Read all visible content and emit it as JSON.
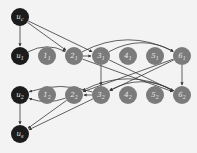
{
  "colors": {
    "background": "#f3f3f3",
    "dark_node": "#1c1c1c",
    "gray_node": "#7b7b7b",
    "edge": "#3a3a3a",
    "label": "#e8e8e8"
  },
  "nodes": [
    {
      "id": "uc",
      "label": "u_c",
      "x": 20,
      "y": 17,
      "type": "dark"
    },
    {
      "id": "u1",
      "label": "u_1",
      "x": 20,
      "y": 56,
      "type": "dark"
    },
    {
      "id": "n11",
      "label": "1_1",
      "x": 47,
      "y": 56,
      "type": "gray"
    },
    {
      "id": "n21",
      "label": "2_1",
      "x": 74,
      "y": 56,
      "type": "gray"
    },
    {
      "id": "n31",
      "label": "3_1",
      "x": 101,
      "y": 56,
      "type": "gray"
    },
    {
      "id": "n41",
      "label": "4_1",
      "x": 128,
      "y": 56,
      "type": "gray"
    },
    {
      "id": "n51",
      "label": "5_1",
      "x": 155,
      "y": 56,
      "type": "gray"
    },
    {
      "id": "n61",
      "label": "6_1",
      "x": 182,
      "y": 56,
      "type": "gray"
    },
    {
      "id": "u2",
      "label": "u_2",
      "x": 20,
      "y": 95,
      "type": "dark"
    },
    {
      "id": "n12",
      "label": "1_2",
      "x": 47,
      "y": 95,
      "type": "gray"
    },
    {
      "id": "n22",
      "label": "2_2",
      "x": 74,
      "y": 95,
      "type": "gray"
    },
    {
      "id": "n32",
      "label": "3_2",
      "x": 101,
      "y": 95,
      "type": "gray"
    },
    {
      "id": "n42",
      "label": "4_2",
      "x": 128,
      "y": 95,
      "type": "gray"
    },
    {
      "id": "n52",
      "label": "5_2",
      "x": 155,
      "y": 95,
      "type": "gray"
    },
    {
      "id": "n62",
      "label": "6_2",
      "x": 182,
      "y": 95,
      "type": "gray"
    },
    {
      "id": "us",
      "label": "u_s",
      "x": 20,
      "y": 134,
      "type": "dark"
    }
  ],
  "edges": [
    {
      "from": "uc",
      "to": "u1",
      "curve": 0
    },
    {
      "from": "uc",
      "to": "n21",
      "curve": 0
    },
    {
      "from": "uc",
      "to": "n31",
      "curve": 0
    },
    {
      "from": "u1",
      "to": "n21",
      "curve": -14
    },
    {
      "from": "n21",
      "to": "n31",
      "curve": 0
    },
    {
      "from": "n31",
      "to": "n61",
      "curve": -22
    },
    {
      "from": "n21",
      "to": "n61",
      "curve": -28
    },
    {
      "from": "n31",
      "to": "n32",
      "curve": 0
    },
    {
      "from": "n61",
      "to": "n62",
      "curve": 0
    },
    {
      "from": "n31",
      "to": "n62",
      "curve": 0
    },
    {
      "from": "n61",
      "to": "n32",
      "curve": 0
    },
    {
      "from": "n21",
      "to": "n62",
      "curve": 0
    },
    {
      "from": "n61",
      "to": "n22",
      "curve": 0
    },
    {
      "from": "u2",
      "to": "us",
      "curve": 0
    },
    {
      "from": "n22",
      "to": "us",
      "curve": 0
    },
    {
      "from": "n32",
      "to": "us",
      "curve": 0
    },
    {
      "from": "n22",
      "to": "u2",
      "curve": -10
    },
    {
      "from": "n32",
      "to": "u2",
      "curve": 14
    },
    {
      "from": "n32",
      "to": "n22",
      "curve": 0
    },
    {
      "from": "n62",
      "to": "n32",
      "curve": 22
    },
    {
      "from": "n62",
      "to": "n22",
      "curve": 28
    }
  ]
}
